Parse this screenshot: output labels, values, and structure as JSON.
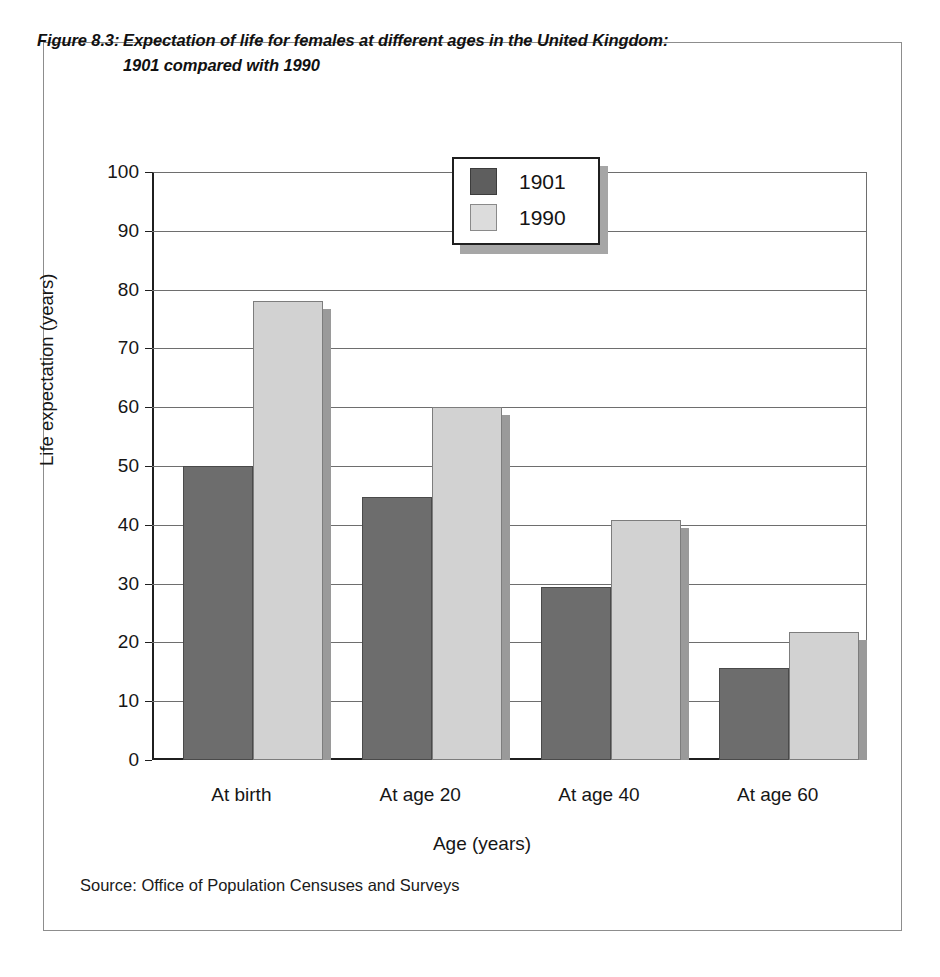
{
  "figure": {
    "label": "Figure 8.3:",
    "title_line1": "Expectation of life for females at different ages in the United Kingdom:",
    "title_line2": "1901 compared with 1990",
    "source": "Source: Office of Population Censuses and Surveys"
  },
  "colors": {
    "series_1901": "#6d6d6d",
    "series_1990": "#d2d2d2",
    "axis": "#1f1f1f",
    "gridline": "#6e6e6e",
    "frame": "#8d8d8d",
    "shadow": "#9a9a9a"
  },
  "chart_data": {
    "type": "bar",
    "xlabel": "Age (years)",
    "ylabel": "Life expectation (years)",
    "categories": [
      "At birth",
      "At age 20",
      "At age 40",
      "At age 60"
    ],
    "series": [
      {
        "name": "1901",
        "values": [
          50.0,
          44.8,
          29.4,
          15.6
        ]
      },
      {
        "name": "1990",
        "values": [
          78.0,
          60.0,
          40.8,
          21.7
        ]
      }
    ],
    "ylim": [
      0,
      100
    ],
    "yticks": [
      0,
      10,
      20,
      30,
      40,
      50,
      60,
      70,
      80,
      90,
      100
    ],
    "ytick_labels": [
      "0",
      "10",
      "20",
      "30",
      "40",
      "50",
      "60",
      "70",
      "80",
      "90",
      "100"
    ],
    "grid": true,
    "legend_position": "upper center",
    "legend_entries": [
      "1901",
      "1990"
    ]
  }
}
